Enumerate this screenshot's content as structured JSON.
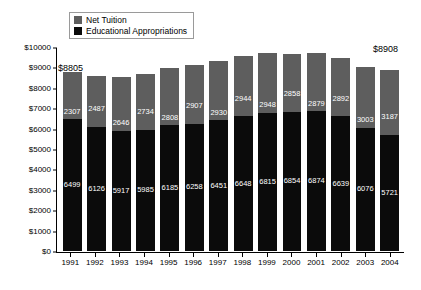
{
  "chart_data": {
    "type": "bar",
    "subtype": "stacked-bar",
    "title": "",
    "xlabel": "",
    "ylabel": "",
    "ylim": [
      0,
      10000
    ],
    "ytick_step": 1000,
    "ytick_labels": [
      "$0",
      "$1000",
      "$2000",
      "$3000",
      "$4000",
      "$5000",
      "$6000",
      "$7000",
      "$8000",
      "$9000",
      "$10000"
    ],
    "grid": false,
    "legend_position": "top-left-inside",
    "categories": [
      "1991",
      "1992",
      "1993",
      "1994",
      "1995",
      "1996",
      "1997",
      "1998",
      "1999",
      "2000",
      "2001",
      "2002",
      "2003",
      "2004"
    ],
    "series": [
      {
        "name": "Educational Appropriations",
        "color": "#0b0b0b",
        "stack_order": 0,
        "values": [
          6499,
          6126,
          5917,
          5985,
          6185,
          6258,
          6451,
          6648,
          6815,
          6854,
          6874,
          6639,
          6076,
          5721
        ]
      },
      {
        "name": "Net Tuition",
        "color": "#5e5e5e",
        "stack_order": 1,
        "values": [
          2307,
          2487,
          2646,
          2734,
          2808,
          2907,
          2930,
          2944,
          2948,
          2858,
          2879,
          2892,
          3003,
          3187
        ]
      }
    ],
    "totals": [
      8806,
      8613,
      8563,
      8719,
      8993,
      9165,
      9381,
      9592,
      9763,
      9712,
      9753,
      9531,
      9079,
      8908
    ],
    "annotations": [
      {
        "text": "$8805",
        "category": "1991",
        "kind": "total-label"
      },
      {
        "text": "$8908",
        "category": "2004",
        "kind": "total-label"
      }
    ]
  },
  "legend": {
    "items": [
      {
        "label": "Net Tuition",
        "color": "#5e5e5e"
      },
      {
        "label": "Educational Appropriations",
        "color": "#0b0b0b"
      }
    ]
  }
}
